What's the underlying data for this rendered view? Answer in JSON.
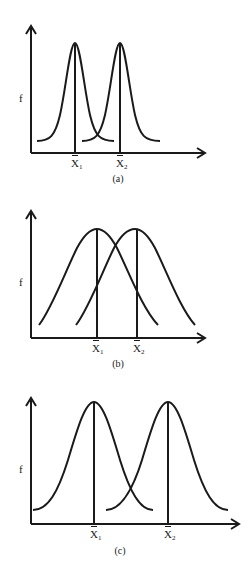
{
  "figure": {
    "panels": [
      {
        "id": "a",
        "caption": "(a)",
        "y_label": "f",
        "x_markers": [
          "X̄1",
          "X̄2"
        ],
        "marker_labels": [
          {
            "base": "X",
            "sub": "1"
          },
          {
            "base": "X",
            "sub": "2"
          }
        ],
        "description": "Two narrow bell curves, well separated, little overlap"
      },
      {
        "id": "b",
        "caption": "(b)",
        "y_label": "f",
        "x_markers": [
          "X̄1",
          "X̄2"
        ],
        "marker_labels": [
          {
            "base": "X",
            "sub": "1"
          },
          {
            "base": "X",
            "sub": "2"
          }
        ],
        "description": "Two wide bell curves, close means, heavy overlap"
      },
      {
        "id": "c",
        "caption": "(c)",
        "y_label": "f",
        "x_markers": [
          "X̄1",
          "X̄2"
        ],
        "marker_labels": [
          {
            "base": "X",
            "sub": "1"
          },
          {
            "base": "X",
            "sub": "2"
          }
        ],
        "description": "Two wide bell curves, means far apart, moderate overlap"
      }
    ],
    "stroke_color": "#1a1a1a",
    "background": "#ffffff"
  }
}
